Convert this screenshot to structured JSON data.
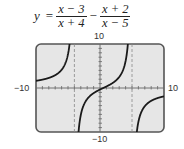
{
  "equation": {
    "lhs": "y",
    "equals": "=",
    "term1": {
      "numerator": "x − 3",
      "denominator": "x + 4"
    },
    "operator": "−",
    "term2": {
      "numerator": "x + 2",
      "denominator": "x − 5"
    }
  },
  "axis_labels": {
    "ymax": "10",
    "ymin": "−10",
    "xmin": "−10",
    "xmax": "10"
  },
  "colors": {
    "screen_bg": "#e6e6e6",
    "frame": "#555555",
    "curve": "#1a1a1a",
    "asymptote": "#888888"
  },
  "chart_data": {
    "type": "line",
    "function": "(x-3)/(x+4) - (x+2)/(x-5)",
    "xlabel": "",
    "ylabel": "",
    "xlim": [
      -10,
      10
    ],
    "ylim": [
      -10,
      10
    ],
    "xscale": 1,
    "yscale": 1,
    "grid": false,
    "vertical_asymptotes": [
      -4,
      5
    ],
    "horizontal_asymptote": 0,
    "tick_labels": {
      "x": [
        "−10",
        "10"
      ],
      "y": [
        "−10",
        "10"
      ]
    },
    "sample_points": [
      {
        "x": -10,
        "y": 1.5
      },
      {
        "x": -8,
        "y": 2.21
      },
      {
        "x": -6,
        "y": 3.86
      },
      {
        "x": -5,
        "y": 7.7
      },
      {
        "x": -3,
        "y": -5.88
      },
      {
        "x": -2,
        "y": -2.36
      },
      {
        "x": 0,
        "y": -0.35
      },
      {
        "x": 2,
        "y": 1.17
      },
      {
        "x": 3,
        "y": 2.5
      },
      {
        "x": 4,
        "y": 5.88
      },
      {
        "x": 6,
        "y": -7.7
      },
      {
        "x": 8,
        "y": -3.08
      },
      {
        "x": 10,
        "y": -1.96
      }
    ]
  }
}
